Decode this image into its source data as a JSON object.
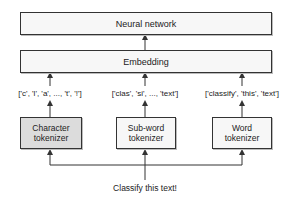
{
  "diagram": {
    "top_box": {
      "label": "Neural network"
    },
    "embedding_box": {
      "label": "Embedding"
    },
    "tokenizers": [
      {
        "id": "character",
        "label_line1": "Character",
        "label_line2": "tokenizer",
        "tokens": "['c', 'l', 'a', ..., 't', '!']",
        "highlighted": true
      },
      {
        "id": "subword",
        "label_line1": "Sub-word",
        "label_line2": "tokenizer",
        "tokens": "['clas', 'si', ..., 'text']",
        "highlighted": false
      },
      {
        "id": "word",
        "label_line1": "Word",
        "label_line2": "tokenizer",
        "tokens": "['classify', 'this', 'text']",
        "highlighted": false
      }
    ],
    "input_text": "Classify this text!",
    "colors": {
      "border": "#333333",
      "box_fill": "#f7f7f7",
      "highlight_fill": "#dcdcdc",
      "arrow": "#333333"
    }
  }
}
